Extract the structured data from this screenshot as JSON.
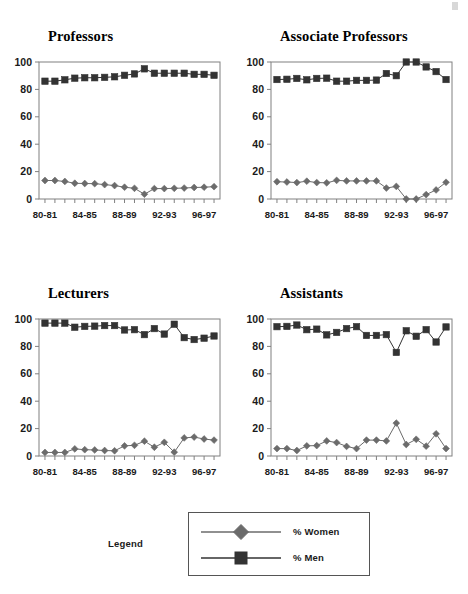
{
  "figure": {
    "legend_title": "Legend",
    "series_names": [
      "% Women",
      "% Men"
    ],
    "corner_mark": "",
    "colors": {
      "women": "#6b6b6b",
      "men": "#333333",
      "axis": "#808080",
      "text": "#1a1a1a"
    }
  },
  "legend": {
    "title": "Legend",
    "items": [
      {
        "label": "% Women",
        "marker": "diamond",
        "color": "#6b6b6b"
      },
      {
        "label": "% Men",
        "marker": "square",
        "color": "#333333"
      }
    ]
  },
  "chart_data": [
    {
      "type": "line",
      "title": "Professors",
      "xlabel": "",
      "ylabel": "",
      "ylim": [
        0,
        100
      ],
      "yticks": [
        0,
        20,
        40,
        60,
        80,
        100
      ],
      "grid": false,
      "legend_position": "figure-bottom",
      "x": [
        "80-81",
        "81-82",
        "82-83",
        "83-84",
        "84-85",
        "85-86",
        "86-87",
        "87-88",
        "88-89",
        "89-90",
        "90-91",
        "91-92",
        "92-93",
        "93-94",
        "94-95",
        "95-96",
        "96-97",
        "97-98"
      ],
      "xtick_labels": [
        "80-81",
        "",
        "",
        "",
        "84-85",
        "",
        "",
        "",
        "88-89",
        "",
        "",
        "",
        "92-93",
        "",
        "",
        "",
        "96-97",
        ""
      ],
      "series": [
        {
          "name": "% Women",
          "marker": "diamond",
          "color": "#6b6b6b",
          "values": [
            13.5,
            13.5,
            12.8,
            11.5,
            11.3,
            11.2,
            10.5,
            9.8,
            8.6,
            7.8,
            3.5,
            7.6,
            7.6,
            7.8,
            8.0,
            8.4,
            8.6,
            9.0
          ]
        },
        {
          "name": "% Men",
          "marker": "square",
          "color": "#333333",
          "values": [
            86.0,
            86.0,
            87.0,
            88.2,
            88.5,
            88.5,
            88.8,
            89.2,
            90.3,
            91.3,
            95.0,
            91.8,
            91.8,
            91.8,
            91.8,
            91.0,
            91.0,
            90.3
          ]
        }
      ]
    },
    {
      "type": "line",
      "title": "Associate Professors",
      "xlabel": "",
      "ylabel": "",
      "ylim": [
        0,
        100
      ],
      "yticks": [
        0,
        20,
        40,
        60,
        80,
        100
      ],
      "grid": false,
      "legend_position": "figure-bottom",
      "x": [
        "80-81",
        "81-82",
        "82-83",
        "83-84",
        "84-85",
        "85-86",
        "86-87",
        "87-88",
        "88-89",
        "89-90",
        "90-91",
        "91-92",
        "92-93",
        "93-94",
        "94-95",
        "95-96",
        "96-97",
        "97-98"
      ],
      "xtick_labels": [
        "80-81",
        "",
        "",
        "",
        "84-85",
        "",
        "",
        "",
        "88-89",
        "",
        "",
        "",
        "92-93",
        "",
        "",
        "",
        "96-97",
        ""
      ],
      "series": [
        {
          "name": "% Women",
          "marker": "diamond",
          "color": "#6b6b6b",
          "values": [
            12.6,
            12.4,
            12.0,
            13.0,
            12.0,
            11.8,
            13.6,
            13.2,
            13.2,
            13.2,
            13.2,
            8.0,
            9.2,
            0.0,
            0.0,
            3.2,
            6.6,
            12.2
          ]
        },
        {
          "name": "% Men",
          "marker": "square",
          "color": "#333333",
          "values": [
            87.2,
            87.4,
            88.0,
            87.0,
            88.0,
            88.2,
            86.0,
            86.0,
            86.6,
            86.6,
            86.8,
            91.6,
            90.0,
            100.0,
            100.0,
            96.4,
            93.0,
            87.2
          ]
        }
      ]
    },
    {
      "type": "line",
      "title": "Lecturers",
      "xlabel": "",
      "ylabel": "",
      "ylim": [
        0,
        100
      ],
      "yticks": [
        0,
        20,
        40,
        60,
        80,
        100
      ],
      "grid": false,
      "legend_position": "figure-bottom",
      "x": [
        "80-81",
        "81-82",
        "82-83",
        "83-84",
        "84-85",
        "85-86",
        "86-87",
        "87-88",
        "88-89",
        "89-90",
        "90-91",
        "91-92",
        "92-93",
        "93-94",
        "94-95",
        "95-96",
        "96-97",
        "97-98"
      ],
      "xtick_labels": [
        "80-81",
        "",
        "",
        "",
        "84-85",
        "",
        "",
        "",
        "88-89",
        "",
        "",
        "",
        "92-93",
        "",
        "",
        "",
        "96-97",
        ""
      ],
      "series": [
        {
          "name": "% Women",
          "marker": "diamond",
          "color": "#6b6b6b",
          "values": [
            2.6,
            2.6,
            2.6,
            5.2,
            4.6,
            4.4,
            4.0,
            3.8,
            7.4,
            7.8,
            10.8,
            6.4,
            10.0,
            2.8,
            13.2,
            13.8,
            12.4,
            11.6
          ]
        },
        {
          "name": "% Men",
          "marker": "square",
          "color": "#333333",
          "values": [
            97.0,
            97.0,
            97.0,
            94.0,
            94.6,
            94.8,
            95.2,
            95.2,
            92.0,
            92.2,
            88.6,
            93.0,
            89.0,
            96.2,
            86.4,
            85.0,
            86.0,
            87.6
          ]
        }
      ]
    },
    {
      "type": "line",
      "title": "Assistants",
      "xlabel": "",
      "ylabel": "",
      "ylim": [
        0,
        100
      ],
      "yticks": [
        0,
        20,
        40,
        60,
        80,
        100
      ],
      "grid": false,
      "legend_position": "figure-bottom",
      "x": [
        "80-81",
        "81-82",
        "82-83",
        "83-84",
        "84-85",
        "85-86",
        "86-87",
        "87-88",
        "88-89",
        "89-90",
        "90-91",
        "91-92",
        "92-93",
        "93-94",
        "94-95",
        "95-96",
        "96-97",
        "97-98"
      ],
      "xtick_labels": [
        "80-81",
        "",
        "",
        "",
        "84-85",
        "",
        "",
        "",
        "88-89",
        "",
        "",
        "",
        "92-93",
        "",
        "",
        "",
        "96-97",
        ""
      ],
      "series": [
        {
          "name": "% Women",
          "marker": "diamond",
          "color": "#6b6b6b",
          "values": [
            5.4,
            5.4,
            4.0,
            7.4,
            7.6,
            11.0,
            9.8,
            7.0,
            5.4,
            11.6,
            11.6,
            11.0,
            24.0,
            8.4,
            12.2,
            7.2,
            16.2,
            5.4
          ]
        },
        {
          "name": "% Men",
          "marker": "square",
          "color": "#333333",
          "values": [
            94.4,
            94.6,
            95.6,
            92.2,
            92.6,
            88.4,
            90.2,
            93.0,
            94.4,
            88.0,
            88.0,
            88.6,
            75.6,
            91.4,
            87.4,
            92.2,
            83.2,
            94.2
          ]
        }
      ]
    }
  ]
}
